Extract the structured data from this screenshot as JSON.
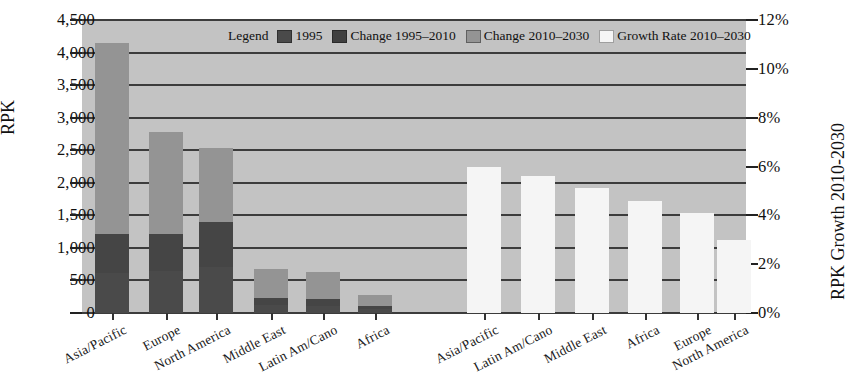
{
  "chart_data": {
    "type": "bar",
    "title": "",
    "ylabel": "RPK",
    "ylabel_right": "RPK Growth 2010-2030",
    "xlabel": "",
    "grid": true,
    "legend_position": "top-center",
    "ylim": [
      0,
      4500
    ],
    "ylim_right": [
      0,
      12
    ],
    "yticks": [
      "0",
      "500",
      "1,000",
      "1,500",
      "2,000",
      "2,500",
      "3,000",
      "3,500",
      "4,000",
      "4,500"
    ],
    "ytick_values": [
      0,
      500,
      1000,
      1500,
      2000,
      2500,
      3000,
      3500,
      4000,
      4500
    ],
    "yticks_right": [
      "0%",
      "2%",
      "4%",
      "6%",
      "8%",
      "10%",
      "12%"
    ],
    "ytick_values_right": [
      0,
      2,
      4,
      6,
      8,
      10,
      12
    ],
    "legend_title": "Legend",
    "series": [
      {
        "name": "1995",
        "color": "#4a4a4a",
        "axis": "left"
      },
      {
        "name": "Change 1995–2010",
        "color": "#454545",
        "axis": "left"
      },
      {
        "name": "Change 2010–2030",
        "color": "#949494",
        "axis": "left"
      },
      {
        "name": "Growth Rate 2010–2030",
        "color": "#f5f5f5",
        "axis": "right"
      }
    ],
    "rpk_group": {
      "categories": [
        "Asia/Pacific",
        "Europe",
        "North America",
        "Middle East",
        "Latin Am/Cano",
        "Africa"
      ],
      "v1995": [
        620,
        640,
        700,
        120,
        110,
        55
      ],
      "change_1995_2010": [
        600,
        580,
        700,
        110,
        105,
        50
      ],
      "change_2010_2030": [
        2930,
        1560,
        1130,
        450,
        415,
        175
      ],
      "totals": [
        4150,
        2780,
        2530,
        680,
        630,
        280
      ]
    },
    "growth_group": {
      "categories": [
        "Asia/Pacific",
        "Latin Am/Cano",
        "Middle East",
        "Africa",
        "Europe",
        "North America"
      ],
      "values": [
        6.0,
        5.6,
        5.1,
        4.6,
        4.1,
        3.0
      ]
    }
  }
}
